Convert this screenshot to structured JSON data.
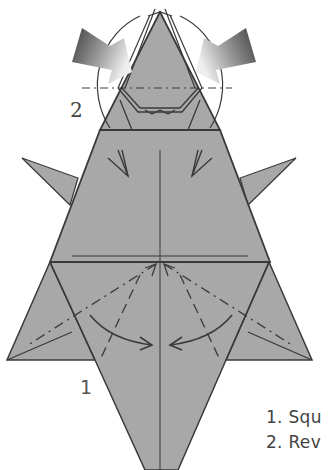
{
  "diagram": {
    "colors": {
      "paper": "#a8a8a8",
      "line": "#3a3a3a",
      "arrow_dark": "#3e3e3e",
      "arrow_light": "#e6e6e6",
      "background": "#ffffff"
    },
    "labels": {
      "step1_marker": "1",
      "step2_marker": "2"
    },
    "captions": [
      "1. Squ",
      "2. Rev"
    ],
    "symbols": [
      {
        "name": "push-arrow-left",
        "meaning": "reverse fold push arrow"
      },
      {
        "name": "push-arrow-right",
        "meaning": "reverse fold push arrow"
      },
      {
        "name": "fold-arrow-left",
        "meaning": "squash fold direction"
      },
      {
        "name": "fold-arrow-right",
        "meaning": "squash fold direction"
      },
      {
        "name": "valley-fold-line",
        "meaning": "dashed line"
      },
      {
        "name": "mountain-fold-line",
        "meaning": "dash-dot line"
      }
    ]
  }
}
